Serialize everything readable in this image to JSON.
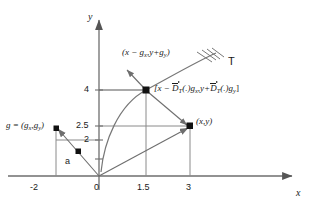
{
  "diagram": {
    "axes": {
      "x_name": "x",
      "y_name": "y"
    },
    "ticks": {
      "x": [
        {
          "label": "-2",
          "value": -2
        },
        {
          "label": "0",
          "value": 0
        },
        {
          "label": "1.5",
          "value": 1.5
        },
        {
          "label": "3",
          "value": 3
        }
      ],
      "y": [
        {
          "label": "4",
          "value": 4
        },
        {
          "label": "2.5",
          "value": 2.5
        },
        {
          "label": "2",
          "value": 2
        }
      ]
    },
    "labels": {
      "g_vector": "g = (g",
      "g_sub1": "x",
      "g_mid": ",g",
      "g_sub2": "y",
      "g_close": ")",
      "point_a": "a",
      "point_xy": "(x,y)",
      "curve_name": "T",
      "shift_point_open": "(x − g",
      "shift_sub1": "x",
      "shift_mid": ",y+g",
      "shift_sub2": "y",
      "shift_close": ")",
      "formula_open": "[x − ",
      "formula_D1": "D",
      "formula_D1sub": "T",
      "formula_mid1": "(.)g",
      "formula_sub_x": "x",
      "formula_mid2": ",y+",
      "formula_D2": "D",
      "formula_D2sub": "T",
      "formula_mid3": "(.)g",
      "formula_sub_y": "y",
      "formula_close": "]"
    },
    "colors": {
      "stroke": "#555555",
      "axis": "#6b6b6b",
      "marker": "#111111",
      "text": "#1a1a1a"
    }
  }
}
